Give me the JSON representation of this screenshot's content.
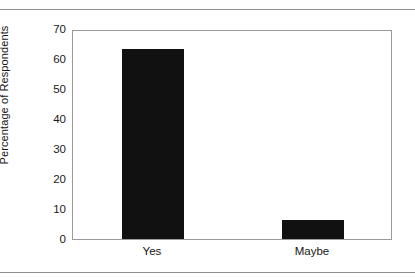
{
  "chart_data": {
    "type": "bar",
    "title": "",
    "subtitle": "",
    "categories": [
      "Yes",
      "Maybe"
    ],
    "values": [
      63.5,
      6.3
    ],
    "series": [
      {
        "name": "Percentage of Respondents",
        "values": [
          63.5,
          6.3
        ]
      }
    ],
    "xlabel": "",
    "ylabel": "Percentage of Respondents",
    "ylim": [
      0,
      70
    ],
    "ytick_step": 10,
    "yticks": [
      "70",
      "60",
      "50",
      "40",
      "30",
      "20",
      "10",
      "0"
    ],
    "ytick_values": [
      70,
      60,
      50,
      40,
      30,
      20,
      10,
      0
    ],
    "grid": false,
    "legend": "none",
    "bar_color": "#111111",
    "frame_color": "#9a9a9a",
    "background": "#ffffff",
    "rules": {
      "top_rule_color": "#8d8d8d",
      "bottom_rule_color": "#8d8d8d"
    }
  }
}
